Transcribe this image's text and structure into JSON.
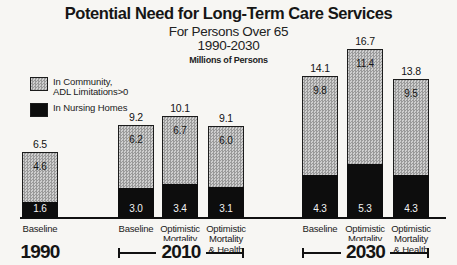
{
  "chart_data": {
    "type": "stacked-bar",
    "title": "Potential Need for Long-Term Care Services",
    "subtitle1": "For Persons Over 65",
    "subtitle2": "1990-2030",
    "units_label": "Millions of Persons",
    "grid": false,
    "legend_position": "upper-left",
    "legend": [
      {
        "label": "In Community,\nADL Limitations>0",
        "style": "hatched-gray",
        "color": "#b5b5b5"
      },
      {
        "label": "In Nursing Homes",
        "style": "solid-black",
        "color": "#0d0d0d"
      }
    ],
    "value_unit": "millions of persons",
    "groups": [
      {
        "year": "1990",
        "bracket": false,
        "bars": [
          {
            "category": "Baseline",
            "total": "6.5",
            "community": "4.6",
            "nursing": "1.6"
          }
        ]
      },
      {
        "year": "2010",
        "bracket": true,
        "bars": [
          {
            "category": "Baseline",
            "total": "9.2",
            "community": "6.2",
            "nursing": "3.0"
          },
          {
            "category": "Optimistic\nMortality",
            "total": "10.1",
            "community": "6.7",
            "nursing": "3.4"
          },
          {
            "category": "Optimistic\nMortality\n& Health",
            "total": "9.1",
            "community": "6.0",
            "nursing": "3.1"
          }
        ]
      },
      {
        "year": "2030",
        "bracket": true,
        "bars": [
          {
            "category": "Baseline",
            "total": "14.1",
            "community": "9.8",
            "nursing": "4.3"
          },
          {
            "category": "Optimistic\nMortality",
            "total": "16.7",
            "community": "11.4",
            "nursing": "5.3"
          },
          {
            "category": "Optimistic\nMortality\n& Health",
            "total": "13.8",
            "community": "9.5",
            "nursing": "4.3"
          }
        ]
      }
    ]
  }
}
